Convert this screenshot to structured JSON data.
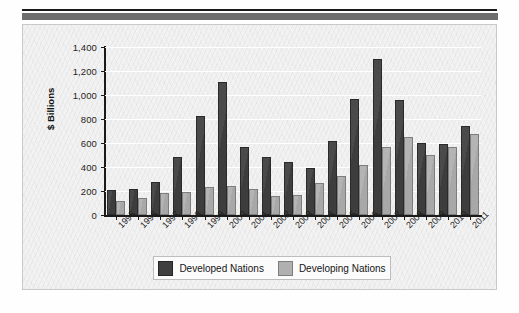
{
  "chart_data": {
    "type": "bar",
    "title": "",
    "xlabel": "",
    "ylabel": "$ Billions",
    "ylim": [
      0,
      1400
    ],
    "ytick_labels": [
      "1,400",
      "1,200",
      "1,000",
      "800",
      "600",
      "400",
      "200",
      "0"
    ],
    "ytick_values": [
      1400,
      1200,
      1000,
      800,
      600,
      400,
      200,
      0
    ],
    "grid": true,
    "legend_position": "bottom",
    "categories": [
      "1995",
      "1996",
      "1997",
      "1998",
      "1999",
      "2000",
      "2001",
      "2002",
      "2003",
      "2004",
      "2005",
      "2006",
      "2007",
      "2008",
      "2009",
      "2010",
      "2011"
    ],
    "series": [
      {
        "name": "Developed Nations",
        "color": "#3f3f3f",
        "values": [
          205,
          220,
          275,
          480,
          825,
          1105,
          570,
          485,
          440,
          390,
          615,
          970,
          1300,
          955,
          600,
          590,
          740
        ]
      },
      {
        "name": "Developing Nations",
        "color": "#b0b0b0",
        "values": [
          115,
          145,
          180,
          195,
          230,
          245,
          215,
          160,
          170,
          270,
          325,
          420,
          565,
          650,
          500,
          565,
          675
        ]
      }
    ]
  }
}
